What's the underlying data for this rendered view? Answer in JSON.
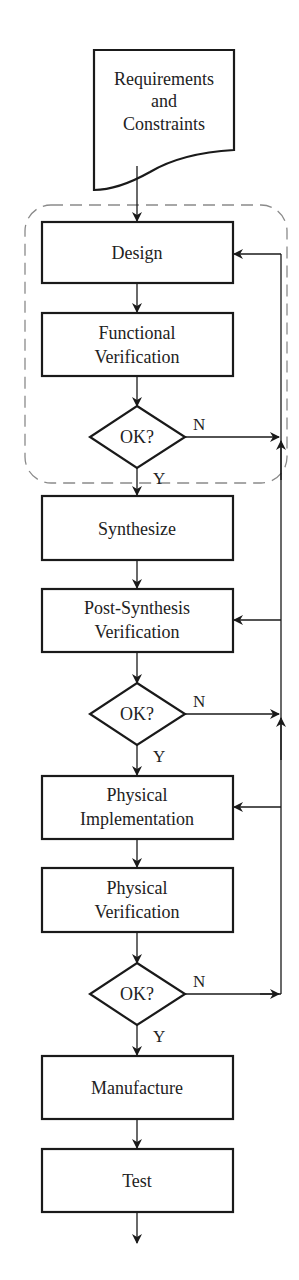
{
  "diagram": {
    "type": "flowchart",
    "colors": {
      "stroke": "#1a1a1a",
      "dashed": "#8a8a8a",
      "text": "#222222",
      "background": "#ffffff"
    },
    "input": {
      "lines": [
        "Requirements",
        "and",
        "Constraints"
      ]
    },
    "steps": [
      {
        "id": "design",
        "lines": [
          "Design"
        ]
      },
      {
        "id": "functional-verification",
        "lines": [
          "Functional",
          "Verification"
        ]
      },
      {
        "id": "synthesize",
        "lines": [
          "Synthesize"
        ]
      },
      {
        "id": "post-synthesis-verification",
        "lines": [
          "Post-Synthesis",
          "Verification"
        ]
      },
      {
        "id": "physical-implementation",
        "lines": [
          "Physical",
          "Implementation"
        ]
      },
      {
        "id": "physical-verification",
        "lines": [
          "Physical",
          "Verification"
        ]
      },
      {
        "id": "manufacture",
        "lines": [
          "Manufacture"
        ]
      },
      {
        "id": "test",
        "lines": [
          "Test"
        ]
      }
    ],
    "decisions": [
      {
        "label": "OK?",
        "no": "N",
        "yes": "Y"
      },
      {
        "label": "OK?",
        "no": "N",
        "yes": "Y"
      },
      {
        "label": "OK?",
        "no": "N",
        "yes": "Y"
      }
    ]
  }
}
